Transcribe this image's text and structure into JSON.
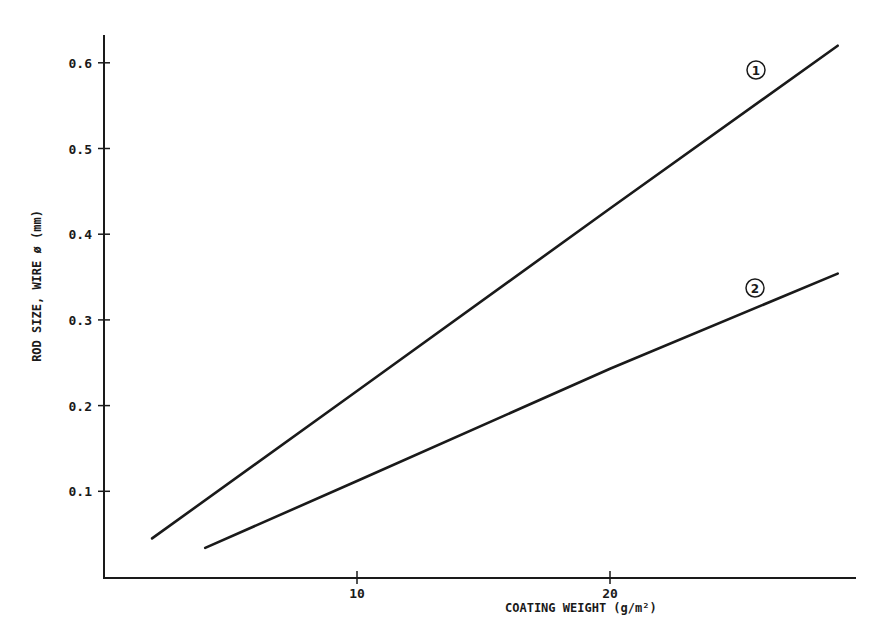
{
  "chart_data": {
    "type": "line",
    "title": "",
    "xlabel": "COATING WEIGHT (g/m²)",
    "ylabel": "ROD SIZE, WIRE ø (mm)",
    "xlim": [
      0,
      29.5
    ],
    "ylim": [
      0,
      0.67
    ],
    "x_ticks": [
      10,
      20
    ],
    "x_tick_labels": [
      "10",
      "20"
    ],
    "y_ticks": [
      0.1,
      0.2,
      0.3,
      0.4,
      0.5,
      0.6
    ],
    "y_tick_labels": [
      "0.1",
      "0.2",
      "0.3",
      "0.4",
      "0.5",
      "0.6"
    ],
    "grid": false,
    "legend": "inline circled numbers near line ends",
    "series": [
      {
        "name": "1",
        "label": "①",
        "x": [
          1.9,
          10,
          20,
          29.0
        ],
        "y": [
          0.045,
          0.217,
          0.43,
          0.62
        ]
      },
      {
        "name": "2",
        "label": "②",
        "x": [
          4.0,
          10,
          20,
          29.0
        ],
        "y": [
          0.034,
          0.112,
          0.243,
          0.354
        ]
      }
    ]
  },
  "colors": {
    "line": "#1a1a1a",
    "background": "#ffffff"
  }
}
